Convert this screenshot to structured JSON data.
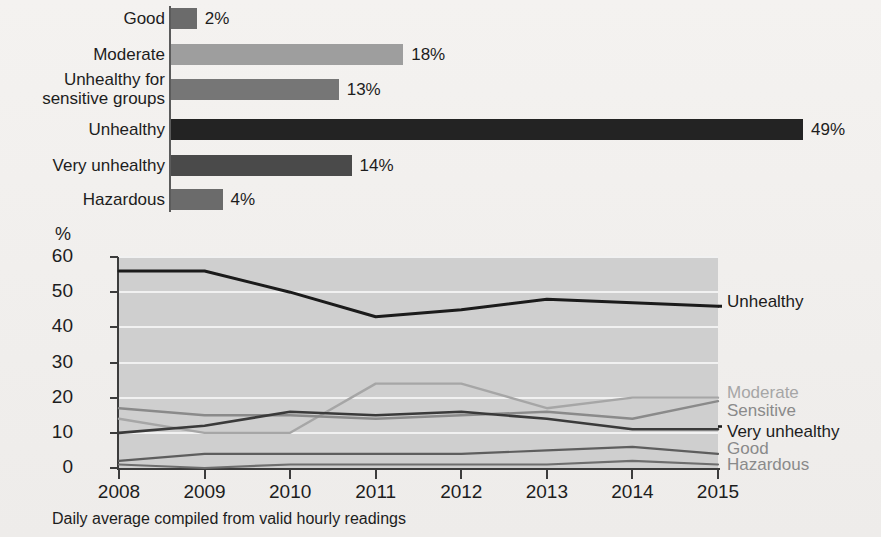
{
  "chart_data": [
    {
      "type": "bar",
      "orientation": "horizontal",
      "title": "",
      "xlabel": "",
      "ylabel": "",
      "categories": [
        "Good",
        "Moderate",
        "Unhealthy for\nsensitive groups",
        "Unhealthy",
        "Very unhealthy",
        "Hazardous"
      ],
      "values": [
        2,
        18,
        13,
        49,
        14,
        4
      ],
      "value_labels": [
        "2%",
        "18%",
        "13%",
        "49%",
        "14%",
        "4%"
      ],
      "colors": [
        "#6b6b6b",
        "#9e9e9e",
        "#767676",
        "#232323",
        "#4a4a4a",
        "#6b6b6b"
      ],
      "xlim": [
        0,
        49
      ],
      "grid": false
    },
    {
      "type": "line",
      "title": "",
      "xlabel": "",
      "ylabel": "%",
      "ylim": [
        0,
        60
      ],
      "yticks": [
        0,
        10,
        20,
        30,
        40,
        50,
        60
      ],
      "ytick_labels": [
        "0",
        "10",
        "20",
        "30",
        "40",
        "50",
        "60"
      ],
      "x": [
        2008,
        2009,
        2010,
        2011,
        2012,
        2013,
        2014,
        2015
      ],
      "xtick_labels": [
        "2008",
        "2009",
        "2010",
        "2011",
        "2012",
        "2013",
        "2014",
        "2015"
      ],
      "grid": true,
      "legend_position": "right",
      "plot_background": "#cfcfcf",
      "footnote": "Daily average compiled from valid hourly readings",
      "series": [
        {
          "name": "Unhealthy",
          "values": [
            56,
            56,
            50,
            43,
            45,
            48,
            47,
            46
          ],
          "color": "#1b1b1b",
          "width": 3.0
        },
        {
          "name": "Moderate",
          "values": [
            14,
            10,
            10,
            24,
            24,
            17,
            20,
            20
          ],
          "color": "#a6a6a6",
          "width": 2.4
        },
        {
          "name": "Sensitive",
          "values": [
            17,
            15,
            15,
            14,
            15,
            16,
            14,
            19
          ],
          "color": "#8a8a8a",
          "width": 2.4
        },
        {
          "name": "Very unhealthy",
          "values": [
            10,
            12,
            16,
            15,
            16,
            14,
            11,
            11
          ],
          "color": "#3a3a3a",
          "width": 2.6
        },
        {
          "name": "Good",
          "values": [
            2,
            4,
            4,
            4,
            4,
            5,
            6,
            4
          ],
          "color": "#5e5e5e",
          "width": 2.2
        },
        {
          "name": "Hazardous",
          "values": [
            1,
            0,
            1,
            1,
            1,
            1,
            2,
            1
          ],
          "color": "#6e6e6e",
          "width": 2.2
        }
      ]
    }
  ],
  "bar_chart": {
    "rows": [
      {
        "label": "Good",
        "value_label": "2%",
        "value": 2,
        "color": "#6b6b6b"
      },
      {
        "label": "Moderate",
        "value_label": "18%",
        "value": 18,
        "color": "#9e9e9e"
      },
      {
        "label": "Unhealthy for\nsensitive groups",
        "value_label": "13%",
        "value": 13,
        "color": "#767676"
      },
      {
        "label": "Unhealthy",
        "value_label": "49%",
        "value": 49,
        "color": "#232323"
      },
      {
        "label": "Very unhealthy",
        "value_label": "14%",
        "value": 14,
        "color": "#4a4a4a"
      },
      {
        "label": "Hazardous",
        "value_label": "4%",
        "value": 4,
        "color": "#6b6b6b"
      }
    ]
  },
  "line_chart": {
    "axis_unit": "%",
    "y_ticks": [
      "60",
      "50",
      "40",
      "30",
      "20",
      "10",
      "0"
    ],
    "x_ticks": [
      "2008",
      "2009",
      "2010",
      "2011",
      "2012",
      "2013",
      "2014",
      "2015"
    ],
    "legend": [
      {
        "label": "Unhealthy",
        "color": "#1b1b1b"
      },
      {
        "label": "Moderate",
        "color": "#a6a6a6"
      },
      {
        "label": "Sensitive",
        "color": "#8a8a8a"
      },
      {
        "label": "Very unhealthy",
        "color": "#1d1d1d"
      },
      {
        "label": "Good",
        "color": "#8a8a8a"
      },
      {
        "label": "Hazardous",
        "color": "#8a8a8a"
      }
    ],
    "footnote": "Daily average compiled from valid hourly readings"
  }
}
